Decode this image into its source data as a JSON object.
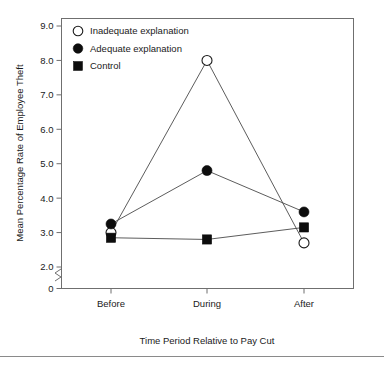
{
  "chart_data": {
    "type": "line",
    "title": "",
    "xlabel": "Time Period Relative to Pay Cut",
    "ylabel": "Mean Percentage Rate of Employee Theft",
    "categories": [
      "Before",
      "During",
      "After"
    ],
    "ylim": [
      2.0,
      9.0
    ],
    "y_ticks": [
      "0",
      "2.0",
      "3.0",
      "4.0",
      "5.0",
      "6.0",
      "7.0",
      "8.0",
      "9.0"
    ],
    "y_axis_break": true,
    "y_axis_break_note": "axis broken between 0 and 2.0",
    "grid": false,
    "legend_position": "top-left-inside",
    "series": [
      {
        "name": "Inadequate explanation",
        "marker": "open-circle",
        "values": [
          3.0,
          8.0,
          2.7
        ]
      },
      {
        "name": "Adequate explanation",
        "marker": "filled-circle",
        "values": [
          3.25,
          4.8,
          3.6
        ]
      },
      {
        "name": "Control",
        "marker": "filled-square",
        "values": [
          2.85,
          2.8,
          3.15
        ]
      }
    ],
    "colors": {
      "marker_fill": "#0d0d0d",
      "marker_open_fill": "#ffffff",
      "line": "#4a4a4a",
      "frame": "#6f6f6f",
      "text": "#1a1a1a",
      "background": "#ffffff"
    }
  },
  "legend": {
    "items": [
      {
        "label": "Inadequate explanation",
        "marker": "open-circle"
      },
      {
        "label": "Adequate explanation",
        "marker": "filled-circle"
      },
      {
        "label": "Control",
        "marker": "filled-square"
      }
    ]
  },
  "axes": {
    "y_title": "Mean Percentage Rate of Employee Theft",
    "x_title": "Time Period Relative to Pay Cut",
    "y_tick_labels": [
      "9.0",
      "8.0",
      "7.0",
      "6.0",
      "5.0",
      "4.0",
      "3.0",
      "2.0",
      "0"
    ],
    "x_tick_labels": [
      "Before",
      "During",
      "After"
    ]
  }
}
